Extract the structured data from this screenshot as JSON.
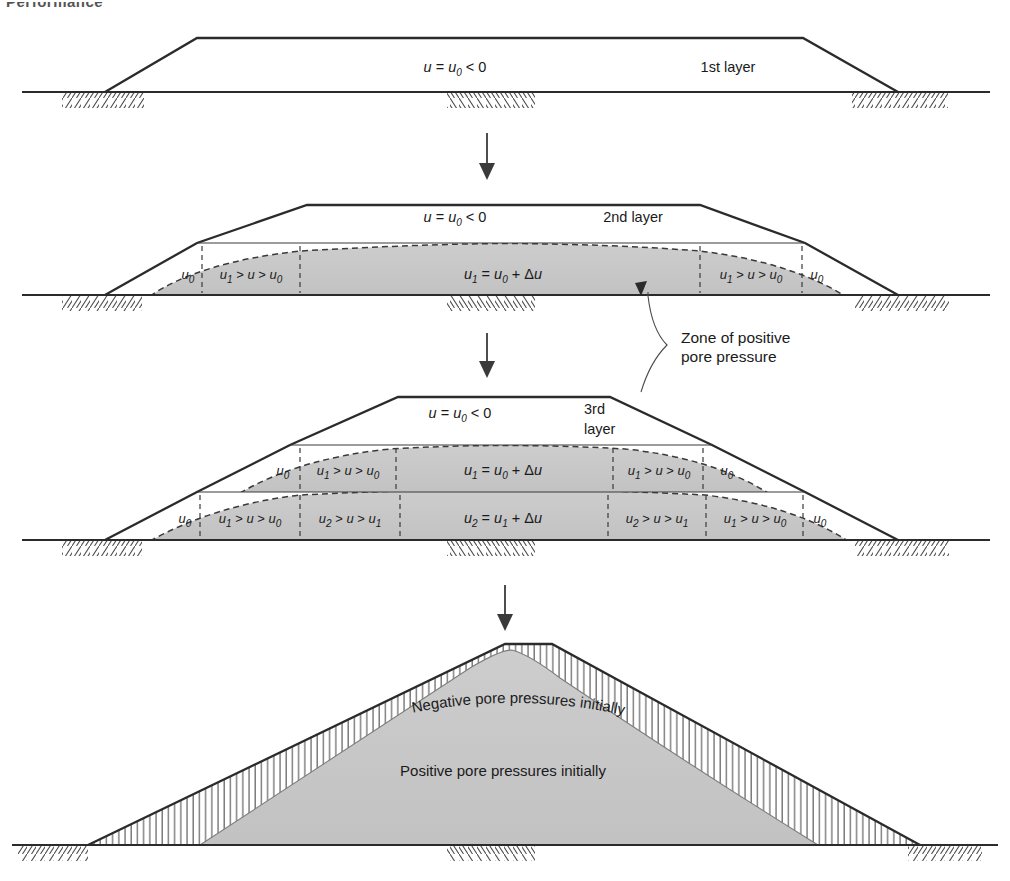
{
  "page": {
    "cut_off_heading": "Performance",
    "background": "#ffffff",
    "ink_color": "#1a1a1a",
    "shade_color": "#c9c9c9",
    "line_color": "#2b2b2b"
  },
  "diagram": {
    "type": "engineering-section-diagram",
    "stage_count": 4,
    "stages": [
      {
        "id": "stage-1",
        "layer_label": "1st layer",
        "crest_label": "u = u0 < 0",
        "crest_label_parts": {
          "lead": "u",
          "eq": " = ",
          "base": "u",
          "base_sub": "0",
          "tail": " < 0"
        },
        "zones": [],
        "center_labels": []
      },
      {
        "id": "stage-2",
        "layer_label": "2nd layer",
        "crest_label": "u = u0 < 0",
        "crest_label_parts": {
          "lead": "u",
          "eq": " = ",
          "base": "u",
          "base_sub": "0",
          "tail": " < 0"
        },
        "zones": [
          {
            "pos": "outer-left",
            "text": "u0",
            "parts": [
              "u",
              "0"
            ]
          },
          {
            "pos": "inner-left",
            "text": "u1 > u > u0",
            "parts": [
              "u",
              "1",
              " > ",
              "u",
              " > ",
              "u",
              "0"
            ]
          },
          {
            "pos": "center",
            "text": "u1 = u0 + Δu",
            "parts": [
              "u",
              "1",
              " = ",
              "u",
              "0",
              " + Δ",
              "u"
            ]
          },
          {
            "pos": "inner-right",
            "text": "u1 > u > u0",
            "parts": [
              "u",
              "1",
              " > ",
              "u",
              " > ",
              "u",
              "0"
            ]
          },
          {
            "pos": "outer-right",
            "text": "u0",
            "parts": [
              "u",
              "0"
            ]
          }
        ]
      },
      {
        "id": "stage-3",
        "layer_label": "3rd layer",
        "layer_label_lines": [
          "3rd",
          "layer"
        ],
        "crest_label": "u = u0 < 0",
        "crest_label_parts": {
          "lead": "u",
          "eq": " = ",
          "base": "u",
          "base_sub": "0",
          "tail": " < 0"
        },
        "upper_layer_zones": [
          {
            "pos": "outer-left",
            "text": "u0"
          },
          {
            "pos": "inner-left",
            "text": "u1 > u > u0"
          },
          {
            "pos": "center",
            "text": "u1 = u0 + Δu"
          },
          {
            "pos": "inner-right",
            "text": "u1 > u > u0"
          },
          {
            "pos": "outer-right",
            "text": "u0"
          }
        ],
        "lower_layer_zones": [
          {
            "pos": "outer-left",
            "text": "u0"
          },
          {
            "pos": "left-2",
            "text": "u1 > u > u0"
          },
          {
            "pos": "left-1",
            "text": "u2 > u > u1"
          },
          {
            "pos": "center",
            "text": "u2 = u1 + Δu"
          },
          {
            "pos": "right-1",
            "text": "u2 > u > u1"
          },
          {
            "pos": "right-2",
            "text": "u1 > u > u0"
          },
          {
            "pos": "outer-right",
            "text": "u0"
          }
        ]
      },
      {
        "id": "stage-4",
        "layer_label": "",
        "crest_label": "",
        "zones": [
          {
            "pos": "shell",
            "text": "Negative pore pressures initially",
            "style": "hatched-curved-text"
          },
          {
            "pos": "core",
            "text": "Positive pore pressures initially",
            "style": "shaded"
          }
        ]
      }
    ],
    "annotation": {
      "lines": [
        "Zone of positive",
        "pore pressure"
      ],
      "text": "Zone of positive pore pressure",
      "leader_targets": 2
    },
    "flow_arrows": {
      "count": 3,
      "direction": "down",
      "label": "construction sequence"
    },
    "legend_notes": {
      "shaded_meaning": "zone of positive pore pressure",
      "hatched_meaning": "zone of negative pore pressure"
    }
  }
}
